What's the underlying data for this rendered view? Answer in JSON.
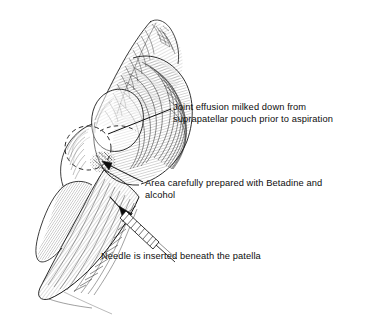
{
  "figure": {
    "kind": "medical-line-illustration",
    "ink_color": "#111111",
    "background_color": "#ffffff",
    "width": 377,
    "height": 319
  },
  "annotations": {
    "effusion": {
      "line1": "Joint effusion milked down from",
      "line2": "suprapatellar pouch prior to aspiration"
    },
    "betadine": {
      "line1": "Area carefully prepared with Betadine and",
      "line2": "alcohol"
    },
    "needle": {
      "line1": "Needle is inserted beneath the patella"
    }
  },
  "parts": {
    "thigh": "thigh-outline",
    "knee": "knee-joint-mass",
    "patella": "patella-outline",
    "pouch": "suprapatellar-pouch-dashed-circle",
    "prep_site": "stippled-prep-site",
    "calf": "lower-leg-outline",
    "syringe": "syringe-with-needle",
    "leaders": [
      "leader-effusion",
      "leader-betadine",
      "leader-needle"
    ]
  }
}
